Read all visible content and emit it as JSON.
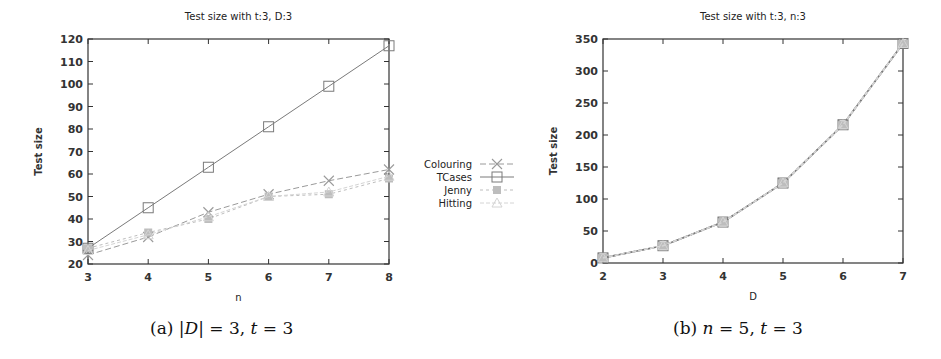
{
  "chart_data": [
    {
      "type": "line",
      "title": "Test size with t:3, D:3",
      "xlabel": "n",
      "ylabel": "Test size",
      "x": [
        3,
        4,
        5,
        6,
        7,
        8
      ],
      "xlim": [
        3,
        8
      ],
      "ylim": [
        20,
        120
      ],
      "yticks": [
        20,
        30,
        40,
        50,
        60,
        70,
        80,
        90,
        100,
        110,
        120
      ],
      "xticks": [
        3,
        4,
        5,
        6,
        7,
        8
      ],
      "grid": false,
      "legend_position": "right-outside",
      "series": [
        {
          "name": "Colouring",
          "marker": "x",
          "values": [
            24,
            32,
            43,
            51,
            57,
            62
          ]
        },
        {
          "name": "TCases",
          "marker": "square",
          "values": [
            27,
            45,
            63,
            81,
            99,
            117
          ]
        },
        {
          "name": "Jenny",
          "marker": "filled-square",
          "values": [
            27,
            34,
            40,
            50,
            51,
            58
          ]
        },
        {
          "name": "Hitting",
          "marker": "triangle",
          "values": [
            26,
            33,
            41,
            50,
            52,
            59
          ]
        }
      ],
      "caption": "(a) |D| = 3, t = 3"
    },
    {
      "type": "line",
      "title": "Test size with t:3, n:3",
      "xlabel": "D",
      "ylabel": "Test size",
      "x": [
        2,
        3,
        4,
        5,
        6,
        7
      ],
      "xlim": [
        2,
        7
      ],
      "ylim": [
        0,
        350
      ],
      "yticks": [
        0,
        50,
        100,
        150,
        200,
        250,
        300,
        350
      ],
      "xticks": [
        2,
        3,
        4,
        5,
        6,
        7
      ],
      "grid": false,
      "series": [
        {
          "name": "Colouring",
          "marker": "x",
          "values": [
            8,
            27,
            64,
            125,
            216,
            343
          ]
        },
        {
          "name": "TCases",
          "marker": "square",
          "values": [
            8,
            27,
            64,
            125,
            216,
            343
          ]
        },
        {
          "name": "Jenny",
          "marker": "filled-square",
          "values": [
            8,
            27,
            64,
            125,
            216,
            343
          ]
        },
        {
          "name": "Hitting",
          "marker": "triangle",
          "values": [
            8,
            27,
            64,
            125,
            216,
            343
          ]
        }
      ],
      "caption": "(b) n = 5, t = 3"
    }
  ],
  "legend": {
    "items": [
      "Colouring",
      "TCases",
      "Jenny",
      "Hitting"
    ]
  },
  "captions": {
    "a_label": "(a)",
    "a_expr_D": "|D|",
    "a_expr_rest": " = 3, ",
    "a_t": "t",
    "a_end": " = 3",
    "b_label": "(b)",
    "b_n": "n",
    "b_mid": " = 5, ",
    "b_t": "t",
    "b_end": " = 3"
  },
  "colors": {
    "axis": "#333333",
    "colouring": "#9a9a9a",
    "tcases": "#7a7a7a",
    "jenny": "#bdbdbd",
    "hitting": "#d4d4d4"
  }
}
